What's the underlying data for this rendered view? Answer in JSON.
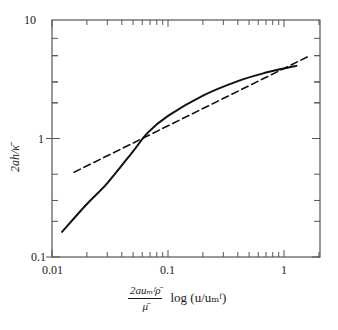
{
  "chart_data": {
    "type": "line",
    "title": "",
    "xlabel_fraction_numerator": "2auₘᶠρ̄",
    "xlabel_fraction_denominator": "μ̄",
    "xlabel_suffix": "log (u/uₘᶠ)",
    "xlabel": "(2a u_mf ρ̄ / μ̄) log(u/u_mf)",
    "ylabel": "2ah/κ̄",
    "xscale": "log",
    "yscale": "log",
    "xlim": [
      0.01,
      2.0
    ],
    "ylim": [
      0.1,
      10
    ],
    "x_ticks": [
      "0.01",
      "0.1",
      "1"
    ],
    "y_ticks": [
      "0.1",
      "1",
      "10"
    ],
    "grid": false,
    "legend": null,
    "series": [
      {
        "name": "theory (solid)",
        "style": "solid",
        "x": [
          0.0122,
          0.02,
          0.03,
          0.05,
          0.067,
          0.1,
          0.2,
          0.4,
          0.7,
          1.0,
          1.28
        ],
        "y": [
          0.163,
          0.28,
          0.42,
          0.78,
          1.12,
          1.55,
          2.3,
          3.05,
          3.6,
          3.9,
          4.1
        ]
      },
      {
        "name": "approximation (dashed)",
        "style": "dashed",
        "x": [
          0.0155,
          1.67
        ],
        "y": [
          0.52,
          5.0
        ]
      }
    ]
  },
  "labels": {
    "y_ticks": [
      "10",
      "1",
      "0.1"
    ],
    "x_ticks": [
      "0.01",
      "0.1",
      "1"
    ],
    "ylabel": "2ah/κ̄",
    "xlabel_num": "2auₘᶠρ̄",
    "xlabel_den": "μ̄",
    "xlabel_suffix": "log (u/uₘᶠ)"
  }
}
